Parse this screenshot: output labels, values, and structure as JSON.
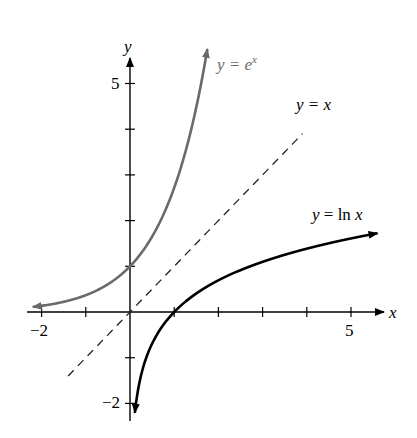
{
  "chart_data": {
    "type": "line",
    "title": "",
    "xlabel": "x",
    "ylabel": "y",
    "xlim": [
      -2.2,
      5.7
    ],
    "ylim": [
      -2.4,
      5.8
    ],
    "grid": false,
    "x_ticks": [
      -2,
      -1,
      0,
      1,
      2,
      3,
      4,
      5
    ],
    "x_tick_labels": [
      {
        "value": -2,
        "label": "−2"
      },
      {
        "value": 5,
        "label": "5"
      }
    ],
    "y_ticks": [
      -2,
      -1,
      1,
      2,
      3,
      4,
      5
    ],
    "y_tick_labels": [
      {
        "value": 5,
        "label": "5"
      },
      {
        "value": -2,
        "label": "−2"
      }
    ],
    "series": [
      {
        "name": "y = e^x",
        "function": "exp",
        "domain": [
          -2.2,
          1.75
        ],
        "color": "#6a6a6a",
        "style": "solid",
        "arrows": "both",
        "label": {
          "text_prefix": "y = e",
          "superscript": "x",
          "x": 2.05,
          "y": 5.45
        }
      },
      {
        "name": "y = x",
        "function": "identity",
        "domain": [
          -1.4,
          3.9
        ],
        "color": "#222222",
        "style": "dashed",
        "arrows": "none",
        "label": {
          "text": "y = x",
          "x": 3.75,
          "y": 4.55
        }
      },
      {
        "name": "y = ln x",
        "function": "ln",
        "domain": [
          0.11,
          5.6
        ],
        "color": "#000000",
        "style": "solid",
        "arrows": "both",
        "label": {
          "text": "y = ln x",
          "x": 4.1,
          "y": 2.0
        }
      }
    ],
    "legend": "inline labels"
  },
  "axes": {
    "x_name": "x",
    "y_name": "y"
  },
  "labels": {
    "exp_prefix": "y = e",
    "exp_sup": "x",
    "identity": "y = x",
    "ln": "y = ln x",
    "x_tick_min": "−2",
    "x_tick_max": "5",
    "y_tick_max": "5",
    "y_tick_min": "−2"
  }
}
